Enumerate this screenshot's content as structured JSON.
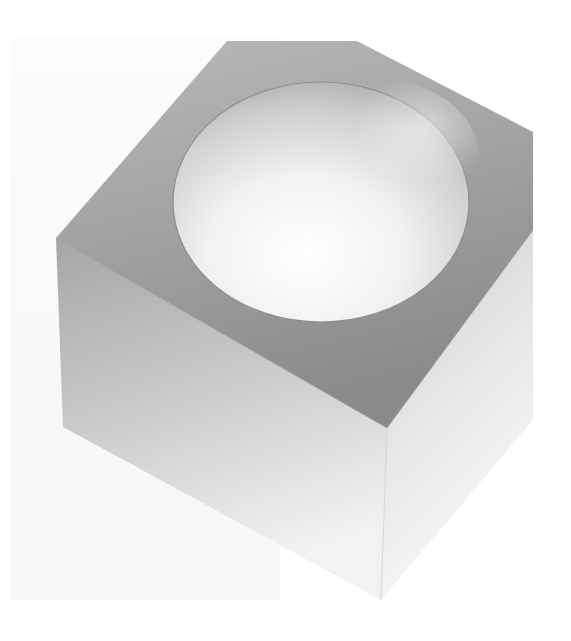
{
  "image": {
    "subject": "Frosted glass cube with hemispherical cavity",
    "alt_text": "Frosted translucent cube with a hemispherical hollow in its top face, on a white background",
    "colors": {
      "background": "#ffffff",
      "top_face": "#9a9a9a",
      "left_face": "#b8b8b8",
      "right_face": "#e2e2e2",
      "cavity_light": "#fbfbfb",
      "cavity_shadow": "#b5b5b5"
    }
  }
}
